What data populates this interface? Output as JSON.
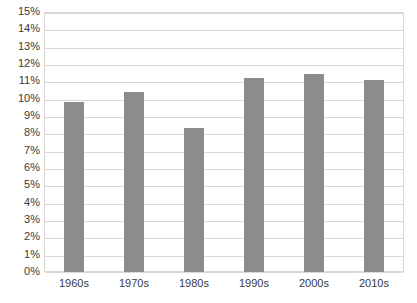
{
  "chart_data": {
    "type": "bar",
    "title": "",
    "subtitle": "",
    "xlabel": "",
    "ylabel": "",
    "categories": [
      "1960s",
      "1970s",
      "1980s",
      "1990s",
      "2000s",
      "2010s"
    ],
    "values": [
      9.8,
      10.4,
      8.3,
      11.2,
      11.4,
      11.1
    ],
    "ylim": [
      0,
      15
    ],
    "ytick_step": 1,
    "ytick_labels": [
      "0%",
      "1%",
      "2%",
      "3%",
      "4%",
      "5%",
      "6%",
      "7%",
      "8%",
      "9%",
      "10%",
      "11%",
      "12%",
      "13%",
      "14%",
      "15%"
    ],
    "ytick_values": [
      0,
      1,
      2,
      3,
      4,
      5,
      6,
      7,
      8,
      9,
      10,
      11,
      12,
      13,
      14,
      15
    ],
    "value_suffix": "%",
    "grid": true,
    "grid_axis": "y",
    "legend": false,
    "legend_position": "none",
    "series": [
      {
        "name": "",
        "values": [
          9.8,
          10.4,
          8.3,
          11.2,
          11.4,
          11.1
        ]
      }
    ],
    "colors": {
      "bar_fill": "#8c8c8c",
      "gridline": "#d9d9d9",
      "plot_border": "#d9d9d9",
      "tick_label": "#3a3a3a",
      "background": "#ffffff"
    }
  }
}
